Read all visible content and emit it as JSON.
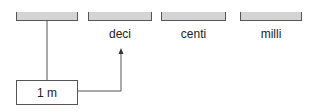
{
  "diagram": {
    "slots": [
      {
        "id": "unit",
        "label": ""
      },
      {
        "id": "deci",
        "label": "deci"
      },
      {
        "id": "centi",
        "label": "centi"
      },
      {
        "id": "milli",
        "label": "milli"
      }
    ],
    "value_box": {
      "label": "1 m"
    },
    "colors": {
      "bar_fill": "#d4d4d4",
      "line": "#555555"
    }
  }
}
